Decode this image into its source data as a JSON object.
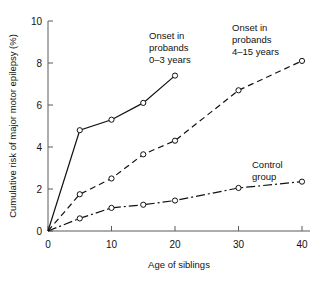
{
  "chart_data": {
    "type": "line",
    "title": "",
    "xlabel": "Age of siblings",
    "ylabel": "Cumulative risk of major motor epilepsy (%)",
    "xlim": [
      0,
      40
    ],
    "ylim": [
      0,
      10
    ],
    "xticks": [
      "0",
      "10",
      "20",
      "30",
      "40"
    ],
    "xtick_values": [
      0,
      10,
      20,
      30,
      40
    ],
    "yticks": [
      "0",
      "2",
      "4",
      "6",
      "8",
      "10"
    ],
    "ytick_values": [
      0,
      2,
      4,
      6,
      8,
      10
    ],
    "grid": false,
    "legend_position": "inline-annotations",
    "series": [
      {
        "name": "Onset in probands 0-3 years",
        "linestyle": "solid",
        "marker": "open-circle",
        "color": "#111111",
        "x": [
          0,
          5,
          10,
          15,
          20
        ],
        "values": [
          0,
          4.8,
          5.3,
          6.1,
          7.4
        ]
      },
      {
        "name": "Onset in probands 4-15 years",
        "linestyle": "dashed",
        "marker": "open-circle",
        "color": "#111111",
        "x": [
          0,
          5,
          10,
          15,
          20,
          30,
          40
        ],
        "values": [
          0,
          1.75,
          2.5,
          3.65,
          4.3,
          6.7,
          8.1
        ]
      },
      {
        "name": "Control group",
        "linestyle": "dashdot",
        "marker": "open-circle",
        "color": "#111111",
        "x": [
          0,
          5,
          10,
          15,
          20,
          30,
          40
        ],
        "values": [
          0,
          0.6,
          1.1,
          1.25,
          1.45,
          2.05,
          2.35
        ]
      }
    ],
    "annotations": [
      {
        "id": "annot-onset-0-3",
        "lines": [
          "Onset in",
          "probands",
          "0–3 years"
        ],
        "x_px": 149,
        "y_px": 39
      },
      {
        "id": "annot-onset-4-15",
        "lines": [
          "Onset in",
          "probands",
          "4–15 years"
        ],
        "x_px": 232,
        "y_px": 31
      },
      {
        "id": "annot-control",
        "lines": [
          "Control",
          "group"
        ],
        "x_px": 252,
        "y_px": 168
      }
    ]
  }
}
